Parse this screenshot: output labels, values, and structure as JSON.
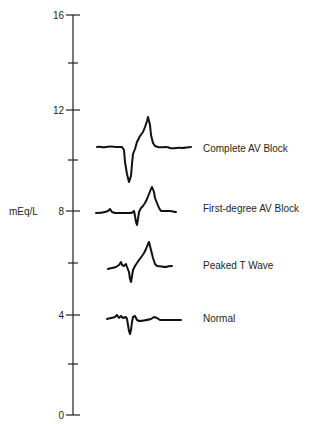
{
  "axis": {
    "unit": "mEq/L",
    "min": 0,
    "max": 16,
    "ticks": [
      {
        "value": 16,
        "label": "16",
        "labeled": true
      },
      {
        "value": 14,
        "label": "",
        "labeled": false
      },
      {
        "value": 12,
        "label": "12",
        "labeled": true
      },
      {
        "value": 10,
        "label": "",
        "labeled": false
      },
      {
        "value": 8,
        "label": "8",
        "labeled": true
      },
      {
        "value": 6,
        "label": "",
        "labeled": false
      },
      {
        "value": 4,
        "label": "4",
        "labeled": true
      },
      {
        "value": 2,
        "label": "",
        "labeled": false
      },
      {
        "value": 0,
        "label": "0",
        "labeled": true
      }
    ]
  },
  "traces": [
    {
      "name": "complete-av-block",
      "label": "Complete AV Block",
      "approx_level": 10.6
    },
    {
      "name": "first-degree-av-block",
      "label": "First-degree AV Block",
      "approx_level": 8
    },
    {
      "name": "peaked-t-wave",
      "label": "Peaked T Wave",
      "approx_level": 5.8
    },
    {
      "name": "normal",
      "label": "Normal",
      "approx_level": 3.8
    }
  ],
  "colors": {
    "ink": "#231f20",
    "trace": "#111111",
    "background": "#ffffff"
  }
}
